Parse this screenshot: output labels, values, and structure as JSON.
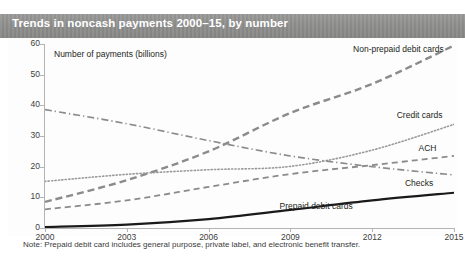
{
  "figure": {
    "title": "Trends in noncash payments 2000–15, by number",
    "note": "Note: Prepaid debit card includes general purpose, private label, and electronic benefit transfer."
  },
  "chart_data": {
    "type": "line",
    "title": "Trends in noncash payments 2000–15, by number",
    "xlabel": "",
    "ylabel": "Number of payments (billions)",
    "xlim": [
      2000,
      2015
    ],
    "ylim": [
      0,
      60
    ],
    "grid": false,
    "legend_position": "inline-right-of-series",
    "x_ticks": [
      "2000",
      "2003",
      "2006",
      "2009",
      "2012",
      "2015"
    ],
    "y_ticks": [
      "0",
      "10",
      "20",
      "30",
      "40",
      "50",
      "60"
    ],
    "x": [
      2000,
      2003,
      2006,
      2009,
      2012,
      2015
    ],
    "series": [
      {
        "name": "Non-prepaid debit cards",
        "style": "thick-dashed",
        "color": "#8b8b8b",
        "values": [
          8.5,
          15.6,
          25.0,
          37.5,
          47.0,
          59.5
        ],
        "label_x": 2011.3,
        "label_y": 58.0
      },
      {
        "name": "Credit cards",
        "style": "dotted",
        "color": "#9a9a9a",
        "values": [
          15.2,
          17.5,
          19.0,
          20.1,
          25.4,
          33.8
        ],
        "label_x": 2012.9,
        "label_y": 36.4
      },
      {
        "name": "ACH",
        "style": "dashed",
        "color": "#8b8b8b",
        "values": [
          6.1,
          9.0,
          13.4,
          17.6,
          20.5,
          23.5
        ],
        "label_x": 2013.7,
        "label_y": 25.8
      },
      {
        "name": "Checks",
        "style": "dash-dot",
        "color": "#8b8b8b",
        "values": [
          38.6,
          34.0,
          28.5,
          23.5,
          20.0,
          17.3
        ],
        "label_x": 2013.2,
        "label_y": 14.2
      },
      {
        "name": "Prepaid debit cards",
        "style": "solid-thick",
        "color": "#1a1a1a",
        "values": [
          0.3,
          1.1,
          2.9,
          5.9,
          9.0,
          11.5
        ],
        "label_x": 2008.6,
        "label_y": 7.0
      }
    ],
    "annotations": [
      "Note: Prepaid debit card includes general purpose, private label, and electronic benefit transfer."
    ]
  }
}
